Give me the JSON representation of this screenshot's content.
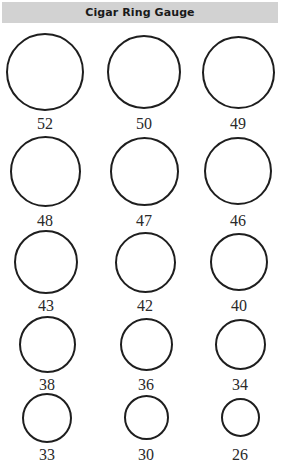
{
  "header": {
    "title": "Cigar Ring Gauge",
    "background": "#d2d2d2"
  },
  "gauges": [
    {
      "label": "52",
      "cx": 45,
      "cy": 72,
      "d": 78,
      "ly": 116
    },
    {
      "label": "50",
      "cx": 144,
      "cy": 72,
      "d": 74,
      "ly": 116
    },
    {
      "label": "49",
      "cx": 238,
      "cy": 72,
      "d": 73,
      "ly": 116
    },
    {
      "label": "48",
      "cx": 45,
      "cy": 171,
      "d": 71,
      "ly": 213
    },
    {
      "label": "47",
      "cx": 144,
      "cy": 171,
      "d": 69,
      "ly": 213
    },
    {
      "label": "46",
      "cx": 238,
      "cy": 171,
      "d": 68,
      "ly": 213
    },
    {
      "label": "43",
      "cx": 46,
      "cy": 262,
      "d": 64,
      "ly": 298
    },
    {
      "label": "42",
      "cx": 145,
      "cy": 262,
      "d": 61,
      "ly": 298
    },
    {
      "label": "40",
      "cx": 239,
      "cy": 262,
      "d": 58,
      "ly": 298
    },
    {
      "label": "38",
      "cx": 47,
      "cy": 344,
      "d": 57,
      "ly": 377
    },
    {
      "label": "36",
      "cx": 146,
      "cy": 344,
      "d": 53,
      "ly": 377
    },
    {
      "label": "34",
      "cx": 240,
      "cy": 344,
      "d": 51,
      "ly": 377
    },
    {
      "label": "33",
      "cx": 47,
      "cy": 418,
      "d": 50,
      "ly": 447
    },
    {
      "label": "30",
      "cx": 146,
      "cy": 417,
      "d": 45,
      "ly": 447
    },
    {
      "label": "26",
      "cx": 240,
      "cy": 417,
      "d": 39,
      "ly": 447
    }
  ]
}
